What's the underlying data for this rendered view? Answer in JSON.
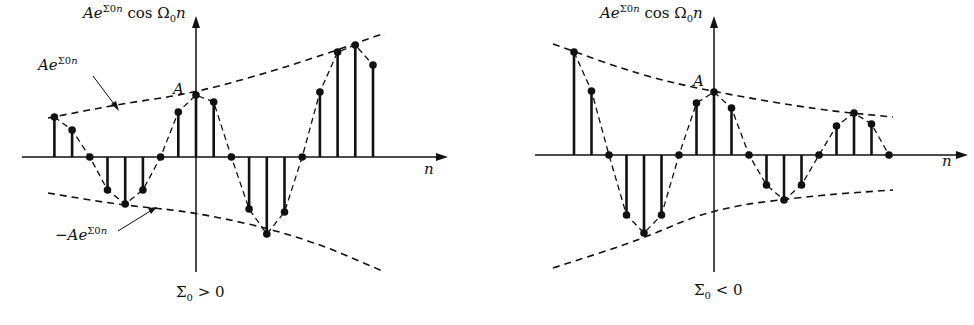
{
  "figure": {
    "left": {
      "y_axis_label": "Ae^{Σ0n} cos Ω0n",
      "upper_envelope_label": "Ae^{Σ0n}",
      "lower_envelope_label": "−Ae^{Σ0n}",
      "amplitude_label": "A",
      "x_axis_label": "n",
      "caption": "Σ0 > 0"
    },
    "right": {
      "y_axis_label": "Ae^{Σ0n} cos Ω0n",
      "amplitude_label": "A",
      "x_axis_label": "n",
      "caption": "Σ0 < 0"
    }
  },
  "chart_data": [
    {
      "type": "stem",
      "title": "Σ0 > 0 (growing envelope)",
      "xlabel": "n",
      "ylabel": "Ae^{Σ0n} cos Ω0n",
      "n": [
        -8,
        -7,
        -6,
        -5,
        -4,
        -3,
        -2,
        -1,
        0,
        1,
        2,
        3,
        4,
        5,
        6,
        7,
        8,
        9,
        10
      ],
      "values": [
        40,
        27,
        0,
        -33,
        -47,
        -33,
        0,
        45,
        62,
        55,
        0,
        -52,
        -77,
        -55,
        0,
        65,
        105,
        112,
        92
      ],
      "envelope": "±Ae^{Σ0n}, increasing"
    },
    {
      "type": "stem",
      "title": "Σ0 < 0 (decaying envelope)",
      "xlabel": "n",
      "ylabel": "Ae^{Σ0n} cos Ω0n",
      "n": [
        -8,
        -7,
        -6,
        -5,
        -4,
        -3,
        -2,
        -1,
        0,
        1,
        2,
        3,
        4,
        5,
        6,
        7,
        8,
        9,
        10
      ],
      "values": [
        103,
        64,
        0,
        -60,
        -78,
        -60,
        0,
        52,
        63,
        47,
        0,
        -30,
        -45,
        -30,
        0,
        29,
        42,
        31,
        0
      ],
      "envelope": "±Ae^{Σ0n}, decreasing"
    }
  ]
}
